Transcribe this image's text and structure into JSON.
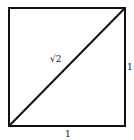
{
  "diagram": {
    "shape": "unit square with diagonal",
    "labels": {
      "diagonal": "√2",
      "right_side": "1",
      "bottom_side": "1"
    },
    "stroke_color": "#111111"
  }
}
